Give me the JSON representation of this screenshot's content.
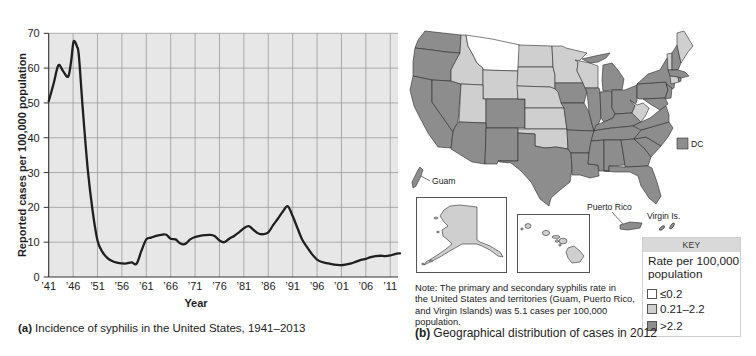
{
  "figure_a": {
    "caption_label": "(a)",
    "caption_text": "Incidence of syphilis in the United States, 1941–2013"
  },
  "figure_b": {
    "caption_label": "(b)",
    "caption_text": "Geographical distribution of cases in 2012",
    "note_lines": [
      "Note: The primary and secondary syphilis rate in",
      "the United States and territories (Guam, Puerto Rico,",
      "and Virgin Islands) was 5.1 cases per 100,000",
      "population."
    ],
    "labels": {
      "guam": "Guam",
      "dc": "DC",
      "puerto_rico": "Puerto Rico",
      "virgin_islands": "Virgin Is."
    },
    "key": {
      "header": "KEY",
      "title_line1": "Rate per 100,000",
      "title_line2": "population",
      "items": [
        {
          "id": "low",
          "label": "≤0.2",
          "color": "#ffffff"
        },
        {
          "id": "mid",
          "label": "0.21–2.2",
          "color": "#cfcfcf"
        },
        {
          "id": "high",
          "label": ">2.2",
          "color": "#8d8d8d"
        }
      ]
    },
    "shading": {
      "MT": "low",
      "ID": "mid",
      "WY": "mid",
      "UT": "mid",
      "ND": "mid",
      "SD": "mid",
      "NE": "mid",
      "KS": "mid",
      "OK": "mid",
      "MN": "mid",
      "WI": "mid",
      "WV": "mid",
      "VT": "mid",
      "ME": "mid",
      "CT": "mid",
      "AK": "mid",
      "HI": "mid",
      "WA": "high",
      "OR": "high",
      "CA": "high",
      "NV": "high",
      "AZ": "high",
      "NM": "high",
      "CO": "high",
      "TX": "high",
      "IA": "high",
      "MO": "high",
      "AR": "high",
      "LA": "high",
      "IL": "high",
      "MI": "high",
      "IN": "high",
      "OH": "high",
      "KY": "high",
      "TN": "high",
      "MS": "high",
      "AL": "high",
      "GA": "high",
      "FL": "high",
      "SC": "high",
      "NC": "high",
      "VA": "high",
      "PA": "high",
      "NY": "high",
      "NJ": "high",
      "MD": "high",
      "NH": "high",
      "MA": "high",
      "RI": "high",
      "DC": "high",
      "GU": "high",
      "PR": "high",
      "VI": "high"
    }
  },
  "chart_data": {
    "type": "line",
    "title": "Incidence of syphilis in the United States, 1941–2013",
    "xlabel": "Year",
    "ylabel": "Reported cases per 100,000 population",
    "xlim": [
      1941,
      2013
    ],
    "ylim": [
      0,
      70
    ],
    "grid": true,
    "legend": null,
    "xtick_years": [
      1941,
      1946,
      1951,
      1956,
      1961,
      1966,
      1971,
      1976,
      1981,
      1986,
      1991,
      1996,
      2001,
      2006,
      2011
    ],
    "xtick_labels": [
      "’41",
      "’46",
      "’51",
      "’56",
      "’61",
      "’66",
      "’71",
      "’76",
      "’81",
      "’86",
      "’91",
      "’96",
      "’01",
      "’06",
      "’11"
    ],
    "yticks": [
      0,
      10,
      20,
      30,
      40,
      50,
      60,
      70
    ],
    "ytick_labels": [
      "0",
      "10",
      "20",
      "30",
      "40",
      "50",
      "60",
      "70"
    ],
    "series": [
      {
        "x": [
          1941,
          1942,
          1943,
          1944,
          1945,
          1945.6,
          1946.1,
          1946.8,
          1947.2,
          1948,
          1949,
          1950,
          1951,
          1952,
          1953,
          1954,
          1955,
          1956,
          1957,
          1958,
          1959,
          1960,
          1961,
          1962,
          1963,
          1964,
          1965,
          1966,
          1967,
          1968,
          1969,
          1970,
          1971,
          1972,
          1973,
          1974,
          1975,
          1976,
          1977,
          1978,
          1979,
          1980,
          1981,
          1982,
          1983,
          1984,
          1985,
          1986,
          1987,
          1988,
          1989,
          1990,
          1991,
          1992,
          1993,
          1994,
          1995,
          1996,
          1997,
          1998,
          1999,
          2000,
          2001,
          2002,
          2003,
          2004,
          2005,
          2006,
          2007,
          2008,
          2009,
          2010,
          2011,
          2012,
          2013
        ],
        "y": [
          50.5,
          55.5,
          60.8,
          59.0,
          57.6,
          62.0,
          67.6,
          66.2,
          63.3,
          48.0,
          31.0,
          19.0,
          10.5,
          7.2,
          5.5,
          4.6,
          4.1,
          3.9,
          3.9,
          4.2,
          3.8,
          7.5,
          10.8,
          11.3,
          11.8,
          12.1,
          12.2,
          11.0,
          10.8,
          9.6,
          9.5,
          10.8,
          11.5,
          11.8,
          12.0,
          12.1,
          11.8,
          10.5,
          10.0,
          11.0,
          11.8,
          12.8,
          14.0,
          14.6,
          13.5,
          12.5,
          12.3,
          12.8,
          14.9,
          16.8,
          18.8,
          20.3,
          17.5,
          14.0,
          10.6,
          8.5,
          6.5,
          5.0,
          4.3,
          4.0,
          3.7,
          3.5,
          3.4,
          3.6,
          3.9,
          4.4,
          4.9,
          5.2,
          5.7,
          6.0,
          6.1,
          6.0,
          6.2,
          6.6,
          6.8
        ]
      }
    ]
  }
}
